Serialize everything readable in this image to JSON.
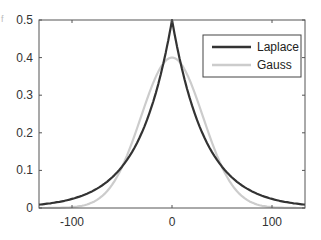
{
  "fragment": "f",
  "chart_data": {
    "type": "line",
    "title": "",
    "xlabel": "",
    "ylabel": "",
    "xlim": [
      -133,
      133
    ],
    "ylim": [
      0,
      0.5
    ],
    "xticks": [
      -100,
      0,
      100
    ],
    "xtick_labels": [
      "-100",
      "0",
      "100"
    ],
    "yticks": [
      0,
      0.1,
      0.2,
      0.3,
      0.4,
      0.5
    ],
    "ytick_labels": [
      "0",
      "0.1",
      "0.2",
      "0.3",
      "0.4",
      "0.5"
    ],
    "grid": false,
    "legend_position": "upper right",
    "series": [
      {
        "name": "Laplace",
        "color": "#333333",
        "x": [
          -133,
          -120,
          -100,
          -80,
          -60,
          -40,
          -20,
          -10,
          0,
          10,
          20,
          40,
          60,
          80,
          100,
          120,
          133
        ],
        "y": [
          0.009,
          0.013,
          0.024,
          0.044,
          0.081,
          0.149,
          0.273,
          0.369,
          0.5,
          0.369,
          0.273,
          0.149,
          0.081,
          0.044,
          0.024,
          0.013,
          0.009
        ]
      },
      {
        "name": "Gauss",
        "color": "#cccccc",
        "x": [
          -133,
          -120,
          -100,
          -80,
          -60,
          -40,
          -20,
          -10,
          0,
          10,
          20,
          40,
          60,
          80,
          100,
          120,
          133
        ],
        "y": [
          0.0,
          0.0,
          0.002,
          0.014,
          0.061,
          0.17,
          0.324,
          0.381,
          0.4,
          0.381,
          0.324,
          0.17,
          0.061,
          0.014,
          0.002,
          0.0,
          0.0
        ]
      }
    ]
  },
  "legend": {
    "items": [
      {
        "label": "Laplace",
        "color": "#333333"
      },
      {
        "label": "Gauss",
        "color": "#cccccc"
      }
    ]
  }
}
